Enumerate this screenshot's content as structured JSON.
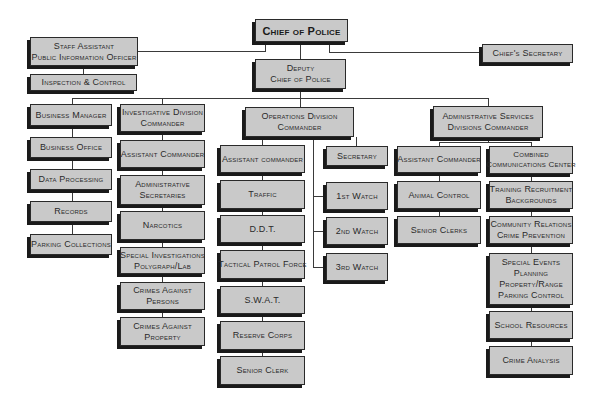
{
  "chart_title": "Police Department Organizational Chart",
  "nodes": {
    "chief": [
      "Chief of Police"
    ],
    "staff_assistant": [
      "Staff Assistant",
      "Public Information Officer"
    ],
    "inspection": [
      "Inspection & Control"
    ],
    "chiefs_secretary": [
      "Chief's Secretary"
    ],
    "deputy": [
      "Deputy",
      "Chief of Police"
    ],
    "business_manager": [
      "Business Manager"
    ],
    "business_office": [
      "Business Office"
    ],
    "data_processing": [
      "Data Processing"
    ],
    "records": [
      "Records"
    ],
    "parking_collections": [
      "Parking Collections"
    ],
    "investigative": [
      "Investigative Division",
      "Commander"
    ],
    "inv_assistant": [
      "Assistant Commander"
    ],
    "admin_secretaries": [
      "Administrative",
      "Secretaries"
    ],
    "narcotics": [
      "Narcotics"
    ],
    "special_investigations": [
      "Special Investigations",
      "Polygraph/Lab"
    ],
    "crimes_persons": [
      "Crimes Against",
      "Persons"
    ],
    "crimes_property": [
      "Crimes Against",
      "Property"
    ],
    "operations": [
      "Operations Division",
      "Commander"
    ],
    "ops_assistant": [
      "Assistant commander"
    ],
    "traffic": [
      "Traffic"
    ],
    "ddt": [
      "D.D.T."
    ],
    "tactical": [
      "Tactical Patrol Force"
    ],
    "swat": [
      "S.W.A.T."
    ],
    "reserve": [
      "Reserve Corps"
    ],
    "senior_clerk": [
      "Senior Clerk"
    ],
    "ops_secretary": [
      "Secretary"
    ],
    "watch1": [
      "1st Watch"
    ],
    "watch2": [
      "2nd Watch"
    ],
    "watch3": [
      "3rd Watch"
    ],
    "admin_services": [
      "Administrative Services",
      "Divisions Commander"
    ],
    "adm_assistant": [
      "Assistant Commander"
    ],
    "animal_control": [
      "Animal Control"
    ],
    "senior_clerks": [
      "Senior Clerks"
    ],
    "communications": [
      "Combined",
      "Communications Center"
    ],
    "training": [
      "Training Recruitment",
      "Backgrounds"
    ],
    "community": [
      "Community Relations",
      "Crime Prevention"
    ],
    "special_events": [
      "Special Events",
      "Planning",
      "Property/Range",
      "Parking Control"
    ],
    "school": [
      "School Resources"
    ],
    "crime_analysis": [
      "Crime Analysis"
    ]
  },
  "colors": {
    "box_fill": "#c9c9c9",
    "box_border": "#2a2a2a",
    "shadow": "#1a1a1a",
    "line": "#3a3a3a",
    "background": "#ffffff"
  }
}
